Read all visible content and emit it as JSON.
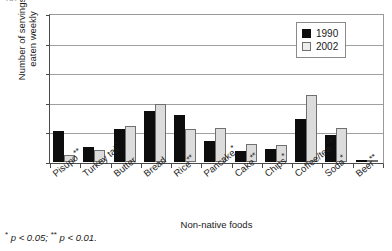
{
  "caption_remnant": "(b)",
  "footnote": {
    "star_one": "*",
    "text_one": " p < 0.05; ",
    "star_two": "**",
    "text_two": " p < 0.01."
  },
  "legend": {
    "position": "top-right",
    "entries": [
      {
        "label": "1990",
        "color": "#0d0d0d"
      },
      {
        "label": "2002",
        "color": "#ededed"
      }
    ]
  },
  "chart_data": {
    "type": "bar",
    "title": "",
    "xlabel": "Non-native foods",
    "ylabel": "Number of servings eaten weekly",
    "ylabel_line1": "Number of servings",
    "ylabel_line2": "eaten weekly",
    "ylim": [
      0,
      25
    ],
    "yticks": [
      0,
      5,
      10,
      15,
      20,
      25
    ],
    "ytick_labels": [
      "0",
      "5",
      "10",
      "15",
      "20",
      "25"
    ],
    "grid": true,
    "legend_position": "upper right",
    "categories": [
      "Pisupo**",
      "Turkey tail*",
      "Butter",
      "Bread",
      "Rice**",
      "Pancake*",
      "Cake**",
      "Chips*",
      "Coffee/tea**",
      "Soda*",
      "Beer**"
    ],
    "category_names": [
      "Pisupo",
      "Turkey tail",
      "Butter",
      "Bread",
      "Rice",
      "Pancake",
      "Cake",
      "Chips",
      "Coffee/tea",
      "Soda",
      "Beer"
    ],
    "category_significance": [
      "**",
      "*",
      "",
      "",
      "**",
      "*",
      "**",
      "*",
      "**",
      "*",
      "**"
    ],
    "series": [
      {
        "name": "1990",
        "color": "#0d0d0d",
        "values": [
          5.3,
          2.5,
          5.6,
          8.6,
          7.9,
          3.5,
          1.8,
          2.2,
          7.3,
          4.6,
          0.1
        ]
      },
      {
        "name": "2002",
        "color": "#ededed",
        "values": [
          1.2,
          2.0,
          6.0,
          9.8,
          5.6,
          5.8,
          3.1,
          2.8,
          11.3,
          5.8,
          0.2
        ]
      }
    ]
  }
}
